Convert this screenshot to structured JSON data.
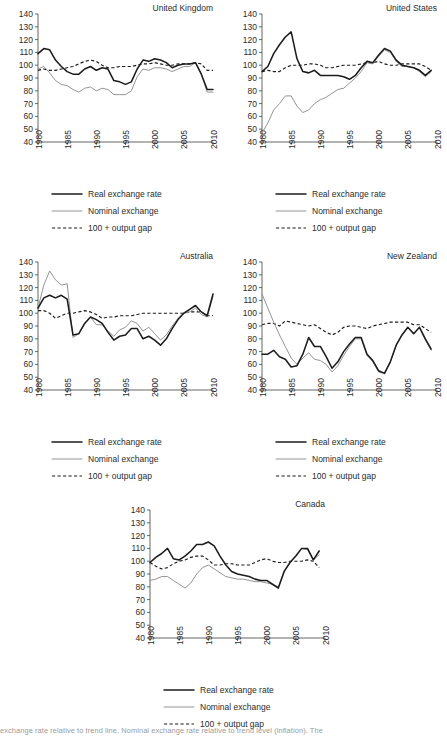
{
  "figure": {
    "caption_partial": "exchange rate relative to trend line. Nominal exchange rate relative to trend level (inflation). The",
    "series_styles": {
      "real_color": "#1c1c1c",
      "nominal_color": "#949494",
      "gap_color": "#1c1c1c"
    }
  },
  "legend": {
    "items": [
      {
        "label": "Real exchange rate",
        "style": "solid-thick",
        "color": "#1c1c1c"
      },
      {
        "label": "Nominal exchange",
        "style": "solid-thin",
        "color": "#949494"
      },
      {
        "label": "100 + output gap",
        "style": "dashed",
        "color": "#1c1c1c"
      }
    ]
  },
  "axes": {
    "y_ticks": [
      40,
      50,
      60,
      70,
      80,
      90,
      100,
      110,
      120,
      130,
      140
    ],
    "x_ticks": [
      1980,
      1985,
      1990,
      1995,
      2000,
      2005,
      2010
    ],
    "ylim": [
      40,
      140
    ],
    "xlim": [
      1980,
      2010
    ]
  },
  "chart_data": [
    {
      "type": "line",
      "title": "United Kingdom",
      "xlabel": "",
      "ylabel": "",
      "ylim": [
        40,
        140
      ],
      "xlim": [
        1980,
        2010
      ],
      "grid": false,
      "legend_position": "below",
      "x": [
        1980,
        1981,
        1982,
        1983,
        1984,
        1985,
        1986,
        1987,
        1988,
        1989,
        1990,
        1991,
        1992,
        1993,
        1994,
        1995,
        1996,
        1997,
        1998,
        1999,
        2000,
        2001,
        2002,
        2003,
        2004,
        2005,
        2006,
        2007,
        2008,
        2009,
        2010
      ],
      "series": [
        {
          "name": "Real exchange rate",
          "values": [
            109,
            113,
            112,
            104,
            99,
            95,
            93,
            93,
            97,
            99,
            96,
            98,
            97,
            88,
            87,
            85,
            87,
            97,
            104,
            103,
            105,
            104,
            102,
            98,
            100,
            101,
            101,
            102,
            93,
            81,
            81
          ]
        },
        {
          "name": "Nominal exchange",
          "values": [
            97,
            99,
            94,
            88,
            85,
            84,
            81,
            79,
            82,
            83,
            80,
            82,
            81,
            77,
            77,
            77,
            80,
            91,
            97,
            96,
            98,
            98,
            97,
            95,
            97,
            99,
            99,
            102,
            93,
            79,
            79
          ]
        },
        {
          "name": "100 + output gap",
          "values": [
            96,
            97,
            96,
            96,
            97,
            98,
            99,
            101,
            103,
            104,
            103,
            100,
            98,
            98,
            99,
            99,
            99,
            100,
            101,
            101,
            102,
            101,
            100,
            100,
            101,
            101,
            101,
            102,
            101,
            96,
            96
          ]
        }
      ]
    },
    {
      "type": "line",
      "title": "United States",
      "xlabel": "",
      "ylabel": "",
      "ylim": [
        40,
        140
      ],
      "xlim": [
        1980,
        2010
      ],
      "grid": false,
      "legend_position": "below",
      "x": [
        1980,
        1981,
        1982,
        1983,
        1984,
        1985,
        1986,
        1987,
        1988,
        1989,
        1990,
        1991,
        1992,
        1993,
        1994,
        1995,
        1996,
        1997,
        1998,
        1999,
        2000,
        2001,
        2002,
        2003,
        2004,
        2005,
        2006,
        2007,
        2008,
        2009
      ],
      "series": [
        {
          "name": "Real exchange rate",
          "values": [
            95,
            99,
            109,
            116,
            122,
            126,
            105,
            95,
            94,
            96,
            92,
            92,
            92,
            92,
            91,
            89,
            92,
            98,
            103,
            102,
            108,
            113,
            111,
            104,
            100,
            99,
            98,
            96,
            92,
            96
          ]
        },
        {
          "name": "Nominal exchange",
          "values": [
            47,
            55,
            65,
            70,
            76,
            76,
            68,
            63,
            65,
            70,
            73,
            75,
            78,
            81,
            82,
            86,
            90,
            95,
            102,
            101,
            107,
            112,
            110,
            103,
            99,
            99,
            98,
            95,
            91,
            95
          ]
        },
        {
          "name": "100 + output gap",
          "values": [
            95,
            96,
            95,
            95,
            98,
            100,
            100,
            100,
            101,
            101,
            100,
            98,
            98,
            99,
            100,
            100,
            100,
            101,
            102,
            102,
            103,
            101,
            100,
            100,
            101,
            101,
            101,
            101,
            99,
            96
          ]
        }
      ]
    },
    {
      "type": "line",
      "title": "Australia",
      "xlabel": "",
      "ylabel": "",
      "ylim": [
        40,
        140
      ],
      "xlim": [
        1980,
        2010
      ],
      "grid": false,
      "legend_position": "below",
      "x": [
        1980,
        1981,
        1982,
        1983,
        1984,
        1985,
        1986,
        1987,
        1988,
        1989,
        1990,
        1991,
        1992,
        1993,
        1994,
        1995,
        1996,
        1997,
        1998,
        1999,
        2000,
        2001,
        2002,
        2003,
        2004,
        2005,
        2006,
        2007,
        2008,
        2009,
        2010
      ],
      "series": [
        {
          "name": "Real exchange rate",
          "values": [
            104,
            112,
            114,
            112,
            114,
            111,
            83,
            84,
            92,
            97,
            95,
            92,
            85,
            79,
            82,
            83,
            88,
            88,
            80,
            82,
            79,
            75,
            80,
            88,
            95,
            100,
            103,
            106,
            101,
            98,
            115
          ]
        },
        {
          "name": "Nominal exchange",
          "values": [
            104,
            122,
            133,
            126,
            122,
            123,
            81,
            84,
            92,
            97,
            91,
            91,
            86,
            82,
            87,
            89,
            94,
            92,
            86,
            89,
            84,
            79,
            83,
            90,
            96,
            100,
            101,
            104,
            99,
            97,
            113
          ]
        },
        {
          "name": "100 + output gap",
          "values": [
            102,
            102,
            100,
            96,
            98,
            100,
            100,
            101,
            102,
            101,
            99,
            96,
            97,
            97,
            98,
            98,
            98,
            99,
            100,
            100,
            100,
            100,
            100,
            100,
            100,
            100,
            101,
            101,
            101,
            98,
            98
          ]
        }
      ]
    },
    {
      "type": "line",
      "title": "New Zealand",
      "xlabel": "",
      "ylabel": "",
      "ylim": [
        40,
        140
      ],
      "xlim": [
        1980,
        2010
      ],
      "grid": false,
      "legend_position": "below",
      "x": [
        1980,
        1981,
        1982,
        1983,
        1984,
        1985,
        1986,
        1987,
        1988,
        1989,
        1990,
        1991,
        1992,
        1993,
        1994,
        1995,
        1996,
        1997,
        1998,
        1999,
        2000,
        2001,
        2002,
        2003,
        2004,
        2005,
        2006,
        2007,
        2008,
        2009
      ],
      "series": [
        {
          "name": "Real exchange rate",
          "values": [
            68,
            68,
            71,
            66,
            64,
            58,
            59,
            68,
            81,
            74,
            74,
            66,
            57,
            62,
            70,
            76,
            81,
            81,
            68,
            63,
            55,
            53,
            62,
            75,
            83,
            89,
            84,
            89,
            80,
            72,
            81
          ]
        },
        {
          "name": "Nominal exchange",
          "values": [
            115,
            104,
            93,
            83,
            74,
            65,
            60,
            65,
            69,
            64,
            63,
            60,
            54,
            59,
            67,
            74,
            80,
            80,
            67,
            62,
            54,
            53,
            62,
            75,
            83,
            89,
            84,
            89,
            79,
            71,
            78
          ]
        },
        {
          "name": "100 + output gap",
          "values": [
            91,
            92,
            92,
            90,
            94,
            93,
            92,
            91,
            90,
            91,
            88,
            85,
            83,
            85,
            89,
            90,
            90,
            89,
            88,
            90,
            91,
            92,
            93,
            93,
            93,
            93,
            91,
            91,
            88,
            85,
            85
          ]
        }
      ]
    },
    {
      "type": "line",
      "title": "Canada",
      "xlabel": "",
      "ylabel": "",
      "ylim": [
        40,
        140
      ],
      "xlim": [
        1980,
        2010
      ],
      "grid": false,
      "legend_position": "below",
      "x": [
        1980,
        1981,
        1982,
        1983,
        1984,
        1985,
        1986,
        1987,
        1988,
        1989,
        1990,
        1991,
        1992,
        1993,
        1994,
        1995,
        1996,
        1997,
        1998,
        1999,
        2000,
        2001,
        2002,
        2003,
        2004,
        2005,
        2006,
        2007,
        2008,
        2009
      ],
      "series": [
        {
          "name": "Real exchange rate",
          "values": [
            99,
            103,
            106,
            110,
            102,
            101,
            104,
            108,
            113,
            113,
            115,
            112,
            104,
            97,
            92,
            90,
            89,
            88,
            86,
            85,
            85,
            82,
            79,
            92,
            99,
            104,
            110,
            110,
            101,
            108,
            113
          ]
        },
        {
          "name": "Nominal exchange",
          "values": [
            85,
            86,
            88,
            88,
            85,
            82,
            79,
            83,
            90,
            95,
            97,
            94,
            91,
            88,
            87,
            86,
            86,
            85,
            84,
            84,
            83,
            82,
            80,
            92,
            99,
            104,
            110,
            109,
            101,
            105,
            113
          ]
        },
        {
          "name": "100 + output gap",
          "values": [
            99,
            96,
            94,
            95,
            98,
            100,
            101,
            103,
            104,
            104,
            101,
            97,
            97,
            98,
            98,
            97,
            97,
            97,
            99,
            101,
            102,
            100,
            99,
            99,
            100,
            100,
            100,
            101,
            100,
            95,
            96
          ]
        }
      ]
    }
  ]
}
